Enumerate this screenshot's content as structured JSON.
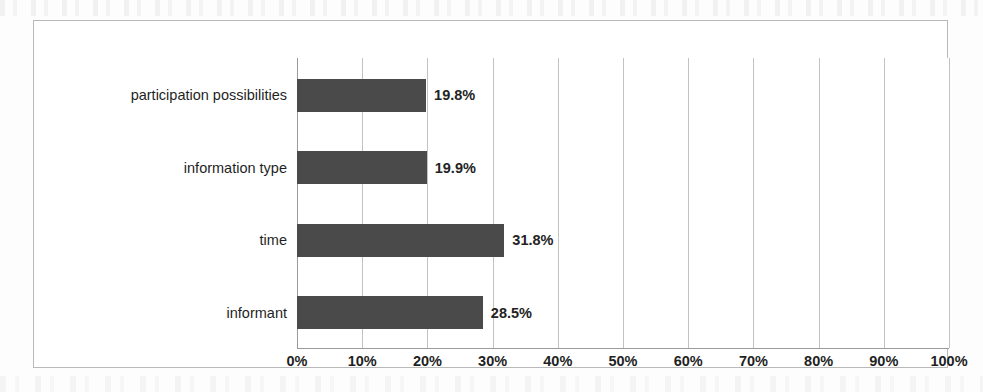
{
  "chart_data": {
    "type": "bar",
    "orientation": "horizontal",
    "title": "",
    "xlabel": "",
    "ylabel": "",
    "categories": [
      "participation possibilities",
      "information type",
      "time",
      "informant"
    ],
    "values": [
      19.8,
      19.9,
      31.8,
      28.5
    ],
    "value_labels": [
      "19.8%",
      "19.9%",
      "31.8%",
      "28.5%"
    ],
    "xlim": [
      0,
      100
    ],
    "xtick_labels": [
      "0%",
      "10%",
      "20%",
      "30%",
      "40%",
      "50%",
      "60%",
      "70%",
      "80%",
      "90%",
      "100%"
    ],
    "xtick_values": [
      0,
      10,
      20,
      30,
      40,
      50,
      60,
      70,
      80,
      90,
      100
    ],
    "grid": true,
    "legend": false,
    "bar_color": "#4a4a4a",
    "gridline_color": "#c2c2c2",
    "axis_color": "#9a9a9a",
    "frame_color": "#b9b9b9",
    "background_color": "#ffffff"
  }
}
